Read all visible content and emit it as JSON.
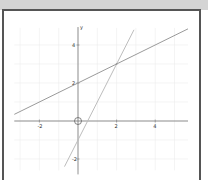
{
  "window": {
    "header_color": "#d4d4d4",
    "border_color": "#555555"
  },
  "chart_data": {
    "type": "line",
    "title": "",
    "xlabel": "",
    "ylabel": "y",
    "xlim": [
      -3.3,
      5.7
    ],
    "ylim": [
      -2.6,
      4.9
    ],
    "grid": true,
    "x_ticks": [
      -2,
      2,
      4
    ],
    "x_tick_labels": [
      "-2",
      "2",
      "4"
    ],
    "y_ticks": [
      -2,
      2,
      4
    ],
    "y_tick_labels": [
      "-2",
      "2",
      "4"
    ],
    "series": [
      {
        "name": "y = 0.5x + 2",
        "slope": 0.5,
        "intercept": 2,
        "x": [
          -3.3,
          5.7
        ],
        "y": [
          0.35,
          4.85
        ],
        "color": "#9a9a9a"
      },
      {
        "name": "y = 2x - 1",
        "slope": 2,
        "intercept": -1,
        "x": [
          -0.7,
          2.9
        ],
        "y": [
          -2.4,
          4.8
        ],
        "color": "#bdbdbd"
      }
    ],
    "annotations": [
      {
        "type": "intersection",
        "x": 2,
        "y": 3
      },
      {
        "type": "origin-circle",
        "x": 0,
        "y": 0
      }
    ]
  }
}
